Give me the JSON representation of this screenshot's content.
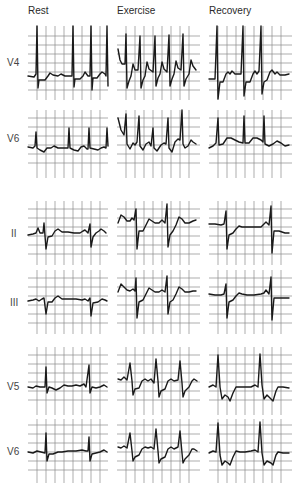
{
  "columns": [
    {
      "title": "Rest",
      "x": 28
    },
    {
      "title": "Exercise",
      "x": 117
    },
    {
      "title": "Recovery",
      "x": 209
    }
  ],
  "leads": [
    {
      "label": "V4",
      "label_y": 57
    },
    {
      "label": "V6",
      "label_y": 133
    },
    {
      "label": "II",
      "label_y": 228
    },
    {
      "label": "III",
      "label_y": 297
    },
    {
      "label": "V5",
      "label_y": 381
    },
    {
      "label": "V6",
      "label_y": 446
    }
  ],
  "colors": {
    "grid": "#8a8a8a",
    "trace": "#1a1a1a",
    "background": "#ffffff"
  }
}
